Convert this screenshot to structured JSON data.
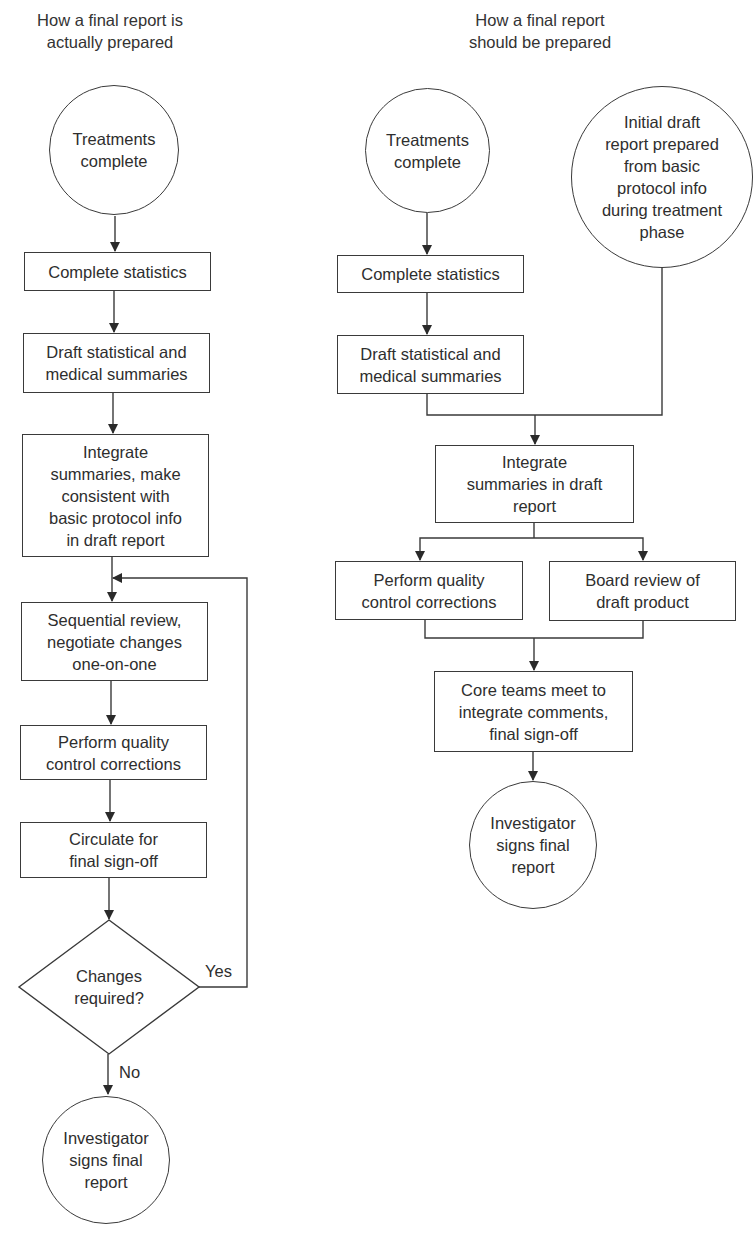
{
  "left_flow": {
    "title": "How a final report is\nactually prepared",
    "nodes": {
      "start": "Treatments\ncomplete",
      "stats": "Complete statistics",
      "draft": "Draft statistical and\nmedical summaries",
      "integrate": "Integrate\nsummaries, make\nconsistent with\nbasic protocol info\nin draft report",
      "review": "Sequential review,\nnegotiate changes\none-on-one",
      "qc": "Perform quality\ncontrol corrections",
      "circulate": "Circulate for\nfinal sign-off",
      "decision": "Changes\nrequired?",
      "end": "Investigator\nsigns final\nreport"
    },
    "edge_labels": {
      "yes": "Yes",
      "no": "No"
    }
  },
  "right_flow": {
    "title": "How a final report\nshould be prepared",
    "nodes": {
      "start": "Treatments\ncomplete",
      "initial": "Initial draft\nreport prepared\nfrom basic\nprotocol info\nduring treatment\nphase",
      "stats": "Complete statistics",
      "draft": "Draft statistical and\nmedical summaries",
      "integrate": "Integrate\nsummaries in draft\nreport",
      "qc": "Perform quality\ncontrol corrections",
      "board": "Board review of\ndraft product",
      "core": "Core teams meet to\nintegrate comments,\nfinal sign-off",
      "end": "Investigator\nsigns final\nreport"
    }
  },
  "colors": {
    "stroke": "#3a3a3a",
    "text": "#2e2e2e",
    "background": "#ffffff"
  }
}
